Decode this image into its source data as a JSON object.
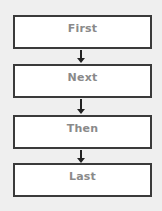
{
  "diagram": {
    "type": "flowchart",
    "direction": "top-to-bottom",
    "steps": [
      {
        "label": "First"
      },
      {
        "label": "Next"
      },
      {
        "label": "Then"
      },
      {
        "label": "Last"
      }
    ],
    "colors": {
      "background": "#efefef",
      "box_fill": "#ffffff",
      "box_border": "#3a3a3a",
      "text": "#8a8a8a",
      "arrow": "#222222"
    }
  }
}
